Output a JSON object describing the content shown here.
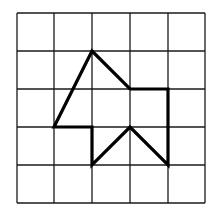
{
  "diagram": {
    "grid": {
      "cols": 5,
      "rows": 5,
      "x_lines": [
        17,
        54,
        92,
        130,
        168,
        205
      ],
      "y_lines": [
        13,
        51,
        89,
        127,
        165,
        203
      ],
      "line_color": "#1a1a1a",
      "line_width": 1.3
    },
    "polygon": {
      "vertices_grid": [
        [
          2,
          1
        ],
        [
          3,
          2
        ],
        [
          4,
          2
        ],
        [
          4,
          4
        ],
        [
          3,
          3
        ],
        [
          2,
          4
        ],
        [
          2,
          3
        ],
        [
          1,
          3
        ]
      ],
      "stroke_color": "#000000",
      "stroke_width": 3.2
    }
  }
}
